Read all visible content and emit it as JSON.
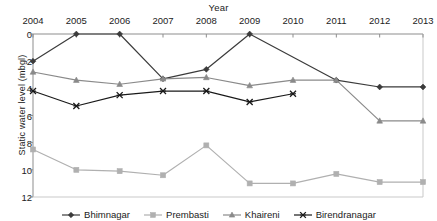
{
  "chart_data": {
    "type": "line",
    "title": "",
    "xlabel": "Year",
    "ylabel": "Static  water level (mbgl)",
    "categories": [
      2004,
      2005,
      2006,
      2007,
      2008,
      2009,
      2010,
      2011,
      2012,
      2013
    ],
    "xlim": [
      2004,
      2013
    ],
    "ylim": [
      0,
      12
    ],
    "y_inverted": true,
    "y_ticks": [
      0,
      2,
      4,
      6,
      8,
      10,
      12
    ],
    "x_ticks": [
      "2004",
      "2005",
      "2006",
      "2007",
      "2008",
      "2009",
      "2010",
      "2011",
      "2012",
      "2013"
    ],
    "grid": false,
    "x_axis_position": "top",
    "legend_position": "bottom",
    "series": [
      {
        "name": "Bhimnagar",
        "marker": "diamond",
        "color": "#3b3b3b",
        "x": [
          2004,
          2005,
          2006,
          2007,
          2008,
          2009,
          2011,
          2012,
          2013
        ],
        "values": [
          2.0,
          0.0,
          0.0,
          3.3,
          2.6,
          0.0,
          3.4,
          3.9,
          3.9
        ]
      },
      {
        "name": "Prembasti",
        "marker": "square",
        "color": "#b0b0b0",
        "x": [
          2004,
          2005,
          2006,
          2007,
          2008,
          2009,
          2010,
          2011,
          2012,
          2013
        ],
        "values": [
          8.5,
          10.0,
          10.1,
          10.4,
          8.2,
          11.0,
          11.0,
          10.3,
          10.9,
          10.9
        ]
      },
      {
        "name": "Khaireni",
        "marker": "triangle",
        "color": "#8a8a8a",
        "x": [
          2004,
          2005,
          2006,
          2007,
          2008,
          2009,
          2010,
          2011,
          2012,
          2013
        ],
        "values": [
          2.8,
          3.4,
          3.7,
          3.3,
          3.2,
          3.8,
          3.4,
          3.4,
          6.4,
          6.4
        ]
      },
      {
        "name": "Birendranagar",
        "marker": "x",
        "color": "#1a1a1a",
        "x": [
          2004,
          2005,
          2006,
          2007,
          2008,
          2009,
          2010
        ],
        "values": [
          4.2,
          5.3,
          4.5,
          4.2,
          4.2,
          5.0,
          4.4
        ]
      }
    ]
  }
}
